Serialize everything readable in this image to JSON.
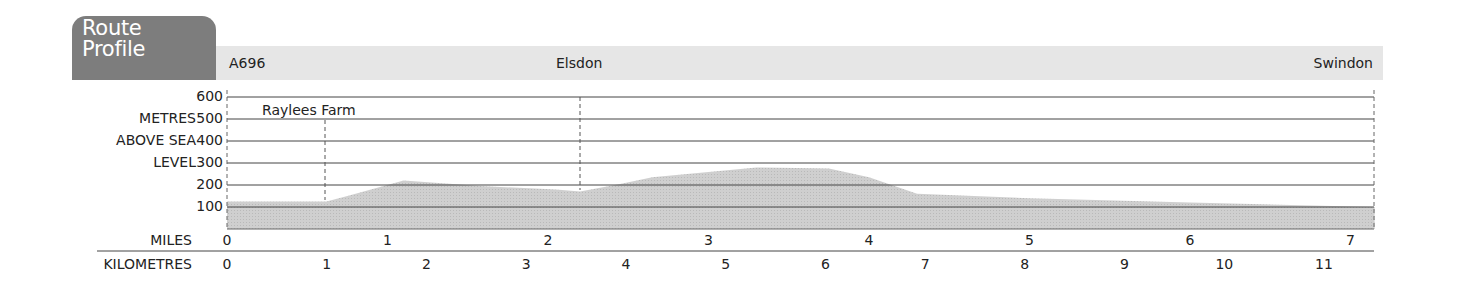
{
  "header": {
    "title_line1": "Route",
    "title_line2": "Profile",
    "start": "A696",
    "middle": "Elsdon",
    "end": "Swindon"
  },
  "axis": {
    "y_label_lines": [
      "METRES",
      "ABOVE SEA",
      "LEVEL"
    ],
    "y_ticks": [
      "600",
      "500",
      "400",
      "300",
      "200",
      "100"
    ],
    "miles_label": "MILES",
    "km_label": "KILOMETRES",
    "miles_ticks": [
      "0",
      "1",
      "2",
      "3",
      "4",
      "5",
      "6",
      "7"
    ],
    "km_ticks": [
      "0",
      "1",
      "2",
      "3",
      "4",
      "5",
      "6",
      "7",
      "8",
      "9",
      "10",
      "11"
    ]
  },
  "annotations": {
    "waypoint": "Raylees Farm"
  },
  "colors": {
    "tab": "#7d7d7d",
    "band": "#e6e6e6",
    "fill": "#c9c9c9",
    "grid": "#444444"
  },
  "chart_data": {
    "type": "area",
    "title": "Route Profile",
    "xlabel": "Distance (miles / kilometres)",
    "ylabel": "METRES ABOVE SEA LEVEL",
    "ylim": [
      0,
      600
    ],
    "xlim_miles": [
      0,
      7.15
    ],
    "grid": true,
    "x_miles": [
      0,
      0,
      0.62,
      0.75,
      1.1,
      1.58,
      2.05,
      2.2,
      2.45,
      2.65,
      3.3,
      3.75,
      4.0,
      4.3,
      5.0,
      6.0,
      7.15
    ],
    "elevation_m": [
      0,
      125,
      125,
      150,
      220,
      195,
      180,
      170,
      205,
      235,
      280,
      275,
      235,
      160,
      140,
      120,
      100
    ],
    "markers": [
      {
        "label": "A696",
        "mile": 0
      },
      {
        "label": "Raylees Farm",
        "mile": 0.61
      },
      {
        "label": "Elsdon",
        "mile": 2.2
      },
      {
        "label": "Swindon",
        "mile": 7.15
      }
    ],
    "miles_ticks": [
      0,
      1,
      2,
      3,
      4,
      5,
      6,
      7
    ],
    "km_ticks": [
      0,
      1,
      2,
      3,
      4,
      5,
      6,
      7,
      8,
      9,
      10,
      11
    ]
  }
}
